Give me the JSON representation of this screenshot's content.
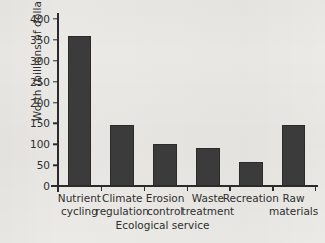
{
  "chart_data": {
    "type": "bar",
    "title": "",
    "xlabel": "Ecological service",
    "ylabel": "Worth (billions of dollars)",
    "categories": [
      "Nutrient cycling",
      "Climate regulation",
      "Erosion control",
      "Waste treatment",
      "Recreation",
      "Raw materials"
    ],
    "category_lines": [
      [
        "Nutrient",
        "cycling"
      ],
      [
        "Climate",
        "regulation"
      ],
      [
        "Erosion",
        "control"
      ],
      [
        "Waste",
        "treatment"
      ],
      [
        "Recreation",
        ""
      ],
      [
        "Raw",
        "materials"
      ]
    ],
    "values": [
      360,
      145,
      100,
      90,
      57,
      145
    ],
    "ylim": [
      0,
      400
    ],
    "yticks": [
      0,
      50,
      100,
      150,
      200,
      250,
      300,
      350,
      400
    ],
    "ytick_labels": [
      "0",
      "50",
      "100",
      "150",
      "200",
      "250",
      "300",
      "350",
      "400"
    ],
    "grid": false,
    "legend": false,
    "bar_color": "#3b3b3b",
    "axis_color": "#2b2b2b",
    "background_color": "#eceae6"
  }
}
